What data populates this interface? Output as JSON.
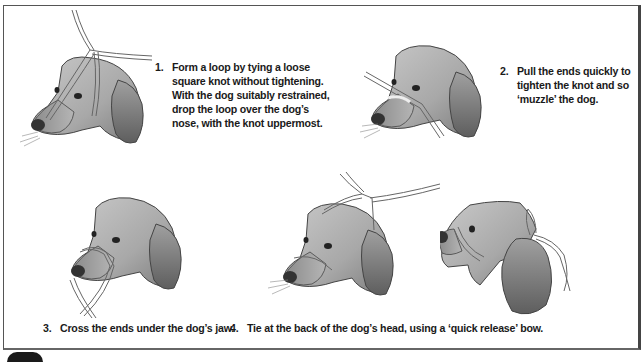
{
  "figure": {
    "steps": [
      {
        "number": "1.",
        "lines": [
          "Form a loop by tying a loose",
          "square knot without tightening.",
          "With the dog suitably restrained,",
          "drop the loop over the dog’s",
          "nose, with the knot uppermost."
        ]
      },
      {
        "number": "2.",
        "lines": [
          "Pull the ends quickly to",
          "tighten the knot and so",
          "‘muzzle’ the dog."
        ]
      },
      {
        "number": "3.",
        "text": "Cross the ends under the dog’s jaw."
      },
      {
        "number": "4.",
        "text": "Tie at the back of the dog’s head, using a ‘quick release’ bow."
      }
    ],
    "illustrations": [
      {
        "id": "dog-step-1",
        "description": "dog head with loose loop over nose, knot on top"
      },
      {
        "id": "dog-step-2",
        "description": "dog head with tightened tape across muzzle"
      },
      {
        "id": "dog-step-3",
        "description": "dog head with tape ends crossed under jaw"
      },
      {
        "id": "dog-step-4a",
        "description": "dog head with tape ends brought up behind ears"
      },
      {
        "id": "dog-step-4b",
        "description": "dog profile with quick-release bow tied behind head"
      }
    ],
    "colors": {
      "border": "#555555",
      "text": "#1a1a1a",
      "dog_fill_light": "#cfcfcf",
      "dog_fill_dark": "#7a7a7a",
      "tape": "#f2f2f2"
    }
  }
}
